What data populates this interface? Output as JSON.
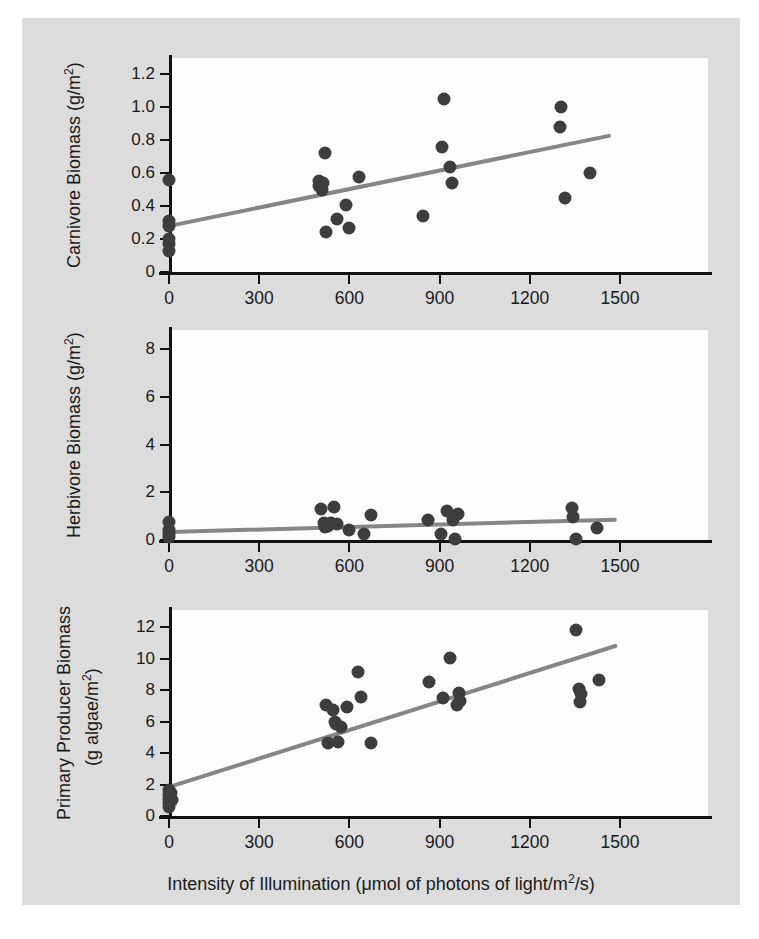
{
  "figure": {
    "background_color": "#dcdcdc",
    "plot_background_color": "#fdfdfd",
    "point_color": "#3d3d3d",
    "trendline_color": "#868686",
    "axis_color": "#111111"
  },
  "xaxis": {
    "title_main": "Intensity of Illumination (",
    "title_mu": "μmol of photons of light/m",
    "title_sup": "2",
    "title_tail": "/s)",
    "title_full": "Intensity of Illumination (μmol of photons of light/m2/s)",
    "ticks": [
      "0",
      "300",
      "600",
      "900",
      "1200",
      "1500"
    ],
    "tick_values": [
      0,
      300,
      600,
      900,
      1200,
      1500
    ],
    "range": [
      -50,
      1580
    ]
  },
  "panels": [
    {
      "id": "carnivore",
      "ylabel_main": "Carnivore Biomass (g/m",
      "ylabel_sup": "2",
      "ylabel_tail": ")",
      "ylabel_full": "Carnivore Biomass (g/m2)",
      "yticks": [
        "0",
        "0.2",
        "0.4",
        "0.6",
        "0.8",
        "1.0",
        "1.2"
      ],
      "ytick_values": [
        0,
        0.2,
        0.4,
        0.6,
        0.8,
        1.0,
        1.2
      ],
      "ylim": [
        0,
        1.3
      ]
    },
    {
      "id": "herbivore",
      "ylabel_main": "Herbivore Biomass (g/m",
      "ylabel_sup": "2",
      "ylabel_tail": ")",
      "ylabel_full": "Herbivore Biomass (g/m2)",
      "yticks": [
        "0",
        "2",
        "4",
        "6",
        "8"
      ],
      "ytick_values": [
        0,
        2,
        4,
        6,
        8
      ],
      "ylim": [
        0,
        8.8
      ]
    },
    {
      "id": "primary-producer",
      "ylabel_line1": "Primary Producer Biomass",
      "ylabel_line2_main": "(g algae/m",
      "ylabel_line2_sup": "2",
      "ylabel_line2_tail": ")",
      "ylabel_full": "Primary Producer Biomass (g algae/m2)",
      "yticks": [
        "0",
        "2",
        "4",
        "6",
        "8",
        "10",
        "12"
      ],
      "ytick_values": [
        0,
        2,
        4,
        6,
        8,
        10,
        12
      ],
      "ylim": [
        0,
        13.1
      ]
    }
  ],
  "chart_data": [
    {
      "type": "scatter",
      "title": "",
      "xlabel": "Intensity of Illumination (μmol of photons of light/m2/s)",
      "ylabel": "Carnivore Biomass (g/m2)",
      "xlim": [
        -50,
        1580
      ],
      "ylim": [
        0,
        1.3
      ],
      "grid": false,
      "legend": "none",
      "points": [
        [
          0,
          0.56
        ],
        [
          0,
          0.31
        ],
        [
          0,
          0.28
        ],
        [
          0,
          0.2
        ],
        [
          0,
          0.17
        ],
        [
          0,
          0.13
        ],
        [
          498,
          0.55
        ],
        [
          500,
          0.52
        ],
        [
          508,
          0.5
        ],
        [
          512,
          0.54
        ],
        [
          520,
          0.72
        ],
        [
          523,
          0.24
        ],
        [
          560,
          0.32
        ],
        [
          590,
          0.41
        ],
        [
          600,
          0.27
        ],
        [
          632,
          0.58
        ],
        [
          845,
          0.34
        ],
        [
          908,
          0.76
        ],
        [
          915,
          1.05
        ],
        [
          935,
          0.64
        ],
        [
          940,
          0.54
        ],
        [
          1300,
          0.88
        ],
        [
          1305,
          1.0
        ],
        [
          1318,
          0.45
        ],
        [
          1400,
          0.6
        ]
      ],
      "trendline": {
        "x0": 0,
        "y0": 0.29,
        "x1": 1470,
        "y1": 0.84
      }
    },
    {
      "type": "scatter",
      "title": "",
      "xlabel": "Intensity of Illumination (μmol of photons of light/m2/s)",
      "ylabel": "Herbivore Biomass (g/m2)",
      "xlim": [
        -50,
        1580
      ],
      "ylim": [
        0,
        8.8
      ],
      "grid": false,
      "legend": "none",
      "points": [
        [
          0,
          0.75
        ],
        [
          0,
          0.4
        ],
        [
          0,
          0.25
        ],
        [
          0,
          0.12
        ],
        [
          505,
          1.3
        ],
        [
          515,
          0.7
        ],
        [
          520,
          0.55
        ],
        [
          530,
          0.6
        ],
        [
          540,
          0.72
        ],
        [
          548,
          1.4
        ],
        [
          560,
          0.65
        ],
        [
          600,
          0.4
        ],
        [
          648,
          0.25
        ],
        [
          672,
          1.05
        ],
        [
          860,
          0.85
        ],
        [
          905,
          0.25
        ],
        [
          925,
          1.2
        ],
        [
          945,
          0.85
        ],
        [
          952,
          0.05
        ],
        [
          960,
          1.1
        ],
        [
          1340,
          1.35
        ],
        [
          1345,
          0.95
        ],
        [
          1355,
          0.05
        ],
        [
          1425,
          0.5
        ]
      ],
      "trendline": {
        "x0": 0,
        "y0": 0.4,
        "x1": 1490,
        "y1": 0.92
      }
    },
    {
      "type": "scatter",
      "title": "",
      "xlabel": "Intensity of Illumination (μmol of photons of light/m2/s)",
      "ylabel": "Primary Producer Biomass (g algae/m2)",
      "xlim": [
        -50,
        1580
      ],
      "ylim": [
        0,
        13.1
      ],
      "grid": false,
      "legend": "none",
      "points": [
        [
          0,
          1.65
        ],
        [
          0,
          1.35
        ],
        [
          0,
          1.1
        ],
        [
          0,
          0.85
        ],
        [
          0,
          0.6
        ],
        [
          8,
          1.45
        ],
        [
          10,
          1.0
        ],
        [
          522,
          7.05
        ],
        [
          530,
          4.65
        ],
        [
          545,
          6.75
        ],
        [
          552,
          6.0
        ],
        [
          555,
          5.85
        ],
        [
          562,
          4.7
        ],
        [
          572,
          5.65
        ],
        [
          592,
          6.9
        ],
        [
          630,
          9.15
        ],
        [
          640,
          7.55
        ],
        [
          672,
          4.65
        ],
        [
          865,
          8.55
        ],
        [
          910,
          7.5
        ],
        [
          935,
          10.05
        ],
        [
          958,
          7.05
        ],
        [
          963,
          7.85
        ],
        [
          968,
          7.3
        ],
        [
          1355,
          11.8
        ],
        [
          1365,
          8.1
        ],
        [
          1368,
          7.25
        ],
        [
          1370,
          7.75
        ],
        [
          1430,
          8.65
        ]
      ],
      "trendline": {
        "x0": 0,
        "y0": 1.95,
        "x1": 1490,
        "y1": 10.95
      }
    }
  ]
}
